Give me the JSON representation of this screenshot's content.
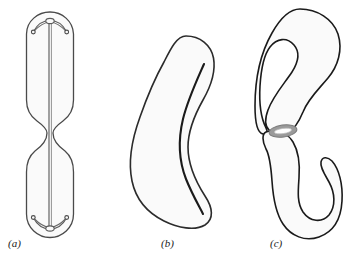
{
  "figure": {
    "background_color": "#ffffff",
    "width": 346,
    "height": 259,
    "panels": [
      {
        "key": "a",
        "label": "(a)",
        "name": "condensed-chromosome-with-centromere",
        "outline_color": "#4a4a4a",
        "fill_color": "#fafafa",
        "axis_line_color": "#555555",
        "loop_color": "#5a5a5a",
        "label_x": 8,
        "label_y": 238
      },
      {
        "key": "b",
        "label": "(b)",
        "name": "bean-shaped-body-with-inner-line",
        "outline_color": "#2b2b2b",
        "fill_color": "#fafafa",
        "inner_line_color": "#1a1a1a",
        "label_x": 161,
        "label_y": 238
      },
      {
        "key": "c",
        "label": "(c)",
        "name": "two-lobes-joined-by-ring",
        "outline_color": "#1a1a1a",
        "fill_color": "#fafafa",
        "ring_color": "#8f8f8f",
        "ring_inner_color": "#ffffff",
        "label_x": 270,
        "label_y": 238
      }
    ]
  },
  "chart_data": {
    "type": "diagram",
    "title": "",
    "subtitle": "",
    "panel_count": 3,
    "panel_labels": [
      "(a)",
      "(b)",
      "(c)"
    ],
    "legend": [],
    "annotations": [],
    "elements": [
      {
        "panel": "(a)",
        "shape": "elongated-rod-with-median-constriction",
        "bbox": [
          26,
          12,
          74,
          238
        ],
        "features": [
          "upper-arm",
          "lower-arm",
          "median-constriction",
          "central-longitudinal-axis-line",
          "upper-loop-with-two-terminal-dots",
          "lower-loop-with-two-terminal-dots"
        ]
      },
      {
        "panel": "(b)",
        "shape": "kidney-bean-outline",
        "bbox": [
          130,
          35,
          215,
          228
        ],
        "features": [
          "concave-right-margin",
          "convex-left-margin",
          "inner-dark-curved-line-along-concave-margin"
        ]
      },
      {
        "panel": "(c)",
        "shape": "two-s-curved-lobes-joined-at-waist",
        "bbox": [
          258,
          8,
          342,
          238
        ],
        "features": [
          "upper-lobe-curving-right",
          "lower-lobe-curving-right",
          "gray-elliptical-ring-at-junction"
        ],
        "ring_center": [
          283,
          131
        ],
        "ring_rx": 14,
        "ring_ry": 6
      }
    ]
  }
}
